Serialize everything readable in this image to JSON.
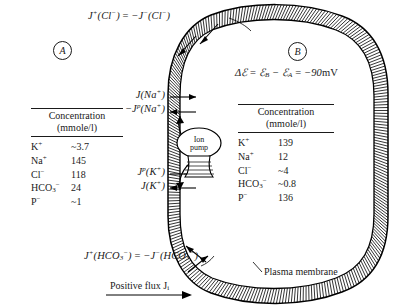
{
  "figure": {
    "compartment_a_label": "A",
    "compartment_b_label": "B",
    "membrane_label": "Plasma membrane",
    "pump_label_line1": "Ion",
    "pump_label_line2": "pump",
    "positive_flux_label": "Positive flux J",
    "positive_flux_sub": "i",
    "potential_equation": "Δℰ = ℰʙ − ℰₐ = −90 mV",
    "colors": {
      "ink": "#1a1a1a",
      "background": "#ffffff",
      "membrane": "#000000"
    }
  },
  "equations": {
    "chloride": {
      "lhs_j": "J",
      "lhs_sup": "+",
      "lhs_species": "(Cl",
      "lhs_species_sup": "−",
      "full": "J⁺(Cl⁻) = −J⁻(Cl⁻)"
    },
    "bicarbonate": {
      "full": "J⁺(HCO₃⁻) = −J⁻(HCO₃⁻)"
    },
    "potential": {
      "delta": "Δℰ",
      "equals": "=",
      "e_b": "ℰ",
      "b_sub": "B",
      "minus": "−",
      "e_a": "ℰ",
      "a_sub": "A",
      "value": "= −90 mV"
    }
  },
  "flux_labels": {
    "na_passive": {
      "j": "J",
      "species": "(Na",
      "charge": "+",
      "close": ")"
    },
    "na_pump": {
      "sign": "−",
      "j": "J",
      "pump_sup": "p",
      "species": "(Na",
      "charge": "+",
      "close": ")"
    },
    "k_pump": {
      "j": "J",
      "pump_sup": "p",
      "species": "(K",
      "charge": "+",
      "close": ")"
    },
    "k_passive": {
      "j": "J",
      "species": "(K",
      "charge": "+",
      "close": ")"
    }
  },
  "table_a": {
    "header_line1": "Concentration",
    "header_line2": "(mmole/l)",
    "rows": [
      {
        "ion": "K",
        "charge": "+",
        "sub": "",
        "value": "~3.7"
      },
      {
        "ion": "Na",
        "charge": "+",
        "sub": "",
        "value": "145"
      },
      {
        "ion": "Cl",
        "charge": "−",
        "sub": "",
        "value": "118"
      },
      {
        "ion": "HCO",
        "charge": "−",
        "sub": "3",
        "value": "24"
      },
      {
        "ion": "P",
        "charge": "−",
        "sub": "",
        "value": "~1"
      }
    ]
  },
  "table_b": {
    "header_line1": "Concentration",
    "header_line2": "(mmole/l)",
    "rows": [
      {
        "ion": "K",
        "charge": "+",
        "sub": "",
        "value": "139"
      },
      {
        "ion": "Na",
        "charge": "+",
        "sub": "",
        "value": "12"
      },
      {
        "ion": "Cl",
        "charge": "−",
        "sub": "",
        "value": "~4"
      },
      {
        "ion": "HCO",
        "charge": "−",
        "sub": "3",
        "value": "~0.8"
      },
      {
        "ion": "P",
        "charge": "−",
        "sub": "",
        "value": "136"
      }
    ]
  }
}
